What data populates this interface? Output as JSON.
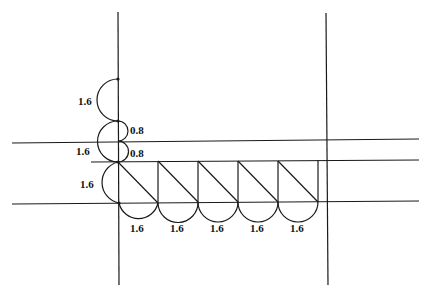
{
  "diagram": {
    "title": "",
    "colors": {
      "line": "#1a1a1a",
      "text": "#111111",
      "background": "#ffffff"
    },
    "left_arcs": [
      {
        "label": "1.6"
      },
      {
        "label": "1.6"
      },
      {
        "label": "1.6"
      }
    ],
    "right_arcs": [
      {
        "label": "0.8"
      },
      {
        "label": "0.8"
      }
    ],
    "bottom_arcs": [
      {
        "label": "1.6"
      },
      {
        "label": "1.6"
      },
      {
        "label": "1.6"
      },
      {
        "label": "1.6"
      },
      {
        "label": "1.6"
      }
    ]
  }
}
